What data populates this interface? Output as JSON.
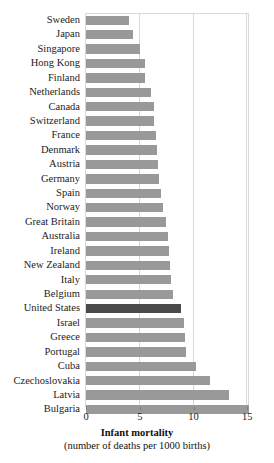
{
  "chart_data": {
    "type": "bar",
    "orientation": "horizontal",
    "title": "Infant mortality",
    "subtitle": "(number of deaths per 1000 births)",
    "xlabel": "Infant mortality",
    "ylabel": "",
    "xlim": [
      0,
      15.25
    ],
    "xticks": [
      0,
      5,
      10,
      15
    ],
    "xtick_labels": [
      "0",
      "5",
      "10",
      "15"
    ],
    "grid": true,
    "grid_axis": "x",
    "legend": false,
    "highlight_category": "United States",
    "colors": {
      "bar": "#999999",
      "bar_highlight": "#4a4a4a",
      "gridline": "#d8d8d8",
      "frame": "#d8d8d8",
      "text": "#1c1c1c",
      "background": "#ffffff"
    },
    "categories": [
      "Sweden",
      "Japan",
      "Singapore",
      "Hong Kong",
      "Finland",
      "Netherlands",
      "Canada",
      "Switzerland",
      "France",
      "Denmark",
      "Austria",
      "Germany",
      "Spain",
      "Norway",
      "Great Britain",
      "Australia",
      "Ireland",
      "New Zealand",
      "Italy",
      "Belgium",
      "United States",
      "Israel",
      "Greece",
      "Portugal",
      "Cuba",
      "Czechoslovakia",
      "Latvia",
      "Bulgaria"
    ],
    "values": [
      4.0,
      4.4,
      5.0,
      5.5,
      5.5,
      6.0,
      6.3,
      6.3,
      6.5,
      6.6,
      6.7,
      6.8,
      7.0,
      7.2,
      7.4,
      7.6,
      7.7,
      7.8,
      7.9,
      8.1,
      8.8,
      9.1,
      9.2,
      9.3,
      10.2,
      11.5,
      13.3,
      15.2
    ]
  }
}
